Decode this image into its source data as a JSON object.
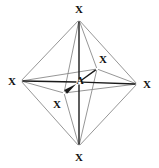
{
  "diagram": {
    "type": "molecular-structure",
    "geometry_name": "octahedral",
    "central_atom_symbol": "A",
    "ligand_symbol": "X",
    "ligand_count": 6,
    "canvas": {
      "width": 159,
      "height": 168
    },
    "colors": {
      "background": "#ffffff",
      "bond_bold": "#1a1a1a",
      "bond_light": "#8a8a8a",
      "label": "#111111"
    },
    "atoms": [
      {
        "id": "x-top",
        "symbol": "X",
        "node_x": 79,
        "node_y": 20,
        "label_x": 79,
        "label_y": 9,
        "role": "axial-top"
      },
      {
        "id": "x-left",
        "symbol": "X",
        "node_x": 21,
        "node_y": 81,
        "label_x": 12,
        "label_y": 81,
        "role": "equatorial-left"
      },
      {
        "id": "x-right",
        "symbol": "X",
        "node_x": 137,
        "node_y": 84,
        "label_x": 147,
        "label_y": 84,
        "role": "equatorial-right"
      },
      {
        "id": "x-bottom",
        "symbol": "X",
        "node_x": 79,
        "node_y": 146,
        "label_x": 79,
        "label_y": 157,
        "role": "axial-bottom"
      },
      {
        "id": "x-back",
        "symbol": "X",
        "node_x": 97,
        "node_y": 69,
        "label_x": 103,
        "label_y": 59,
        "role": "equatorial-back"
      },
      {
        "id": "x-front",
        "symbol": "X",
        "node_x": 64,
        "node_y": 93,
        "label_x": 57,
        "label_y": 104,
        "role": "equatorial-front"
      },
      {
        "id": "a-center",
        "symbol": "A",
        "node_x": 79,
        "node_y": 82,
        "label_x": 80,
        "label_y": 81,
        "role": "central"
      }
    ],
    "bonds": [
      {
        "id": "bond-a-xtop",
        "from": "a-center",
        "to": "x-top",
        "style": "bold"
      },
      {
        "id": "bond-a-xbottom",
        "from": "a-center",
        "to": "x-bottom",
        "style": "bold"
      },
      {
        "id": "bond-a-xleft",
        "from": "a-center",
        "to": "x-left",
        "style": "bold"
      },
      {
        "id": "bond-a-xright",
        "from": "a-center",
        "to": "x-right",
        "style": "bold"
      },
      {
        "id": "bond-a-xback",
        "from": "a-center",
        "to": "x-back",
        "style": "bold"
      },
      {
        "id": "bond-a-xfront",
        "from": "a-center",
        "to": "x-front",
        "style": "wedge"
      }
    ],
    "polyhedron_edges": [
      {
        "id": "edge-top-left",
        "from": "x-top",
        "to": "x-left"
      },
      {
        "id": "edge-top-right",
        "from": "x-top",
        "to": "x-right"
      },
      {
        "id": "edge-bottom-left",
        "from": "x-bottom",
        "to": "x-left"
      },
      {
        "id": "edge-bottom-right",
        "from": "x-bottom",
        "to": "x-right"
      },
      {
        "id": "edge-top-back",
        "from": "x-top",
        "to": "x-back"
      },
      {
        "id": "edge-top-front",
        "from": "x-top",
        "to": "x-front"
      },
      {
        "id": "edge-bottom-back",
        "from": "x-bottom",
        "to": "x-back"
      },
      {
        "id": "edge-bottom-front",
        "from": "x-bottom",
        "to": "x-front"
      },
      {
        "id": "edge-left-back",
        "from": "x-left",
        "to": "x-back"
      },
      {
        "id": "edge-left-front",
        "from": "x-left",
        "to": "x-front"
      },
      {
        "id": "edge-right-back",
        "from": "x-right",
        "to": "x-back"
      },
      {
        "id": "edge-right-front",
        "from": "x-right",
        "to": "x-front"
      }
    ]
  }
}
